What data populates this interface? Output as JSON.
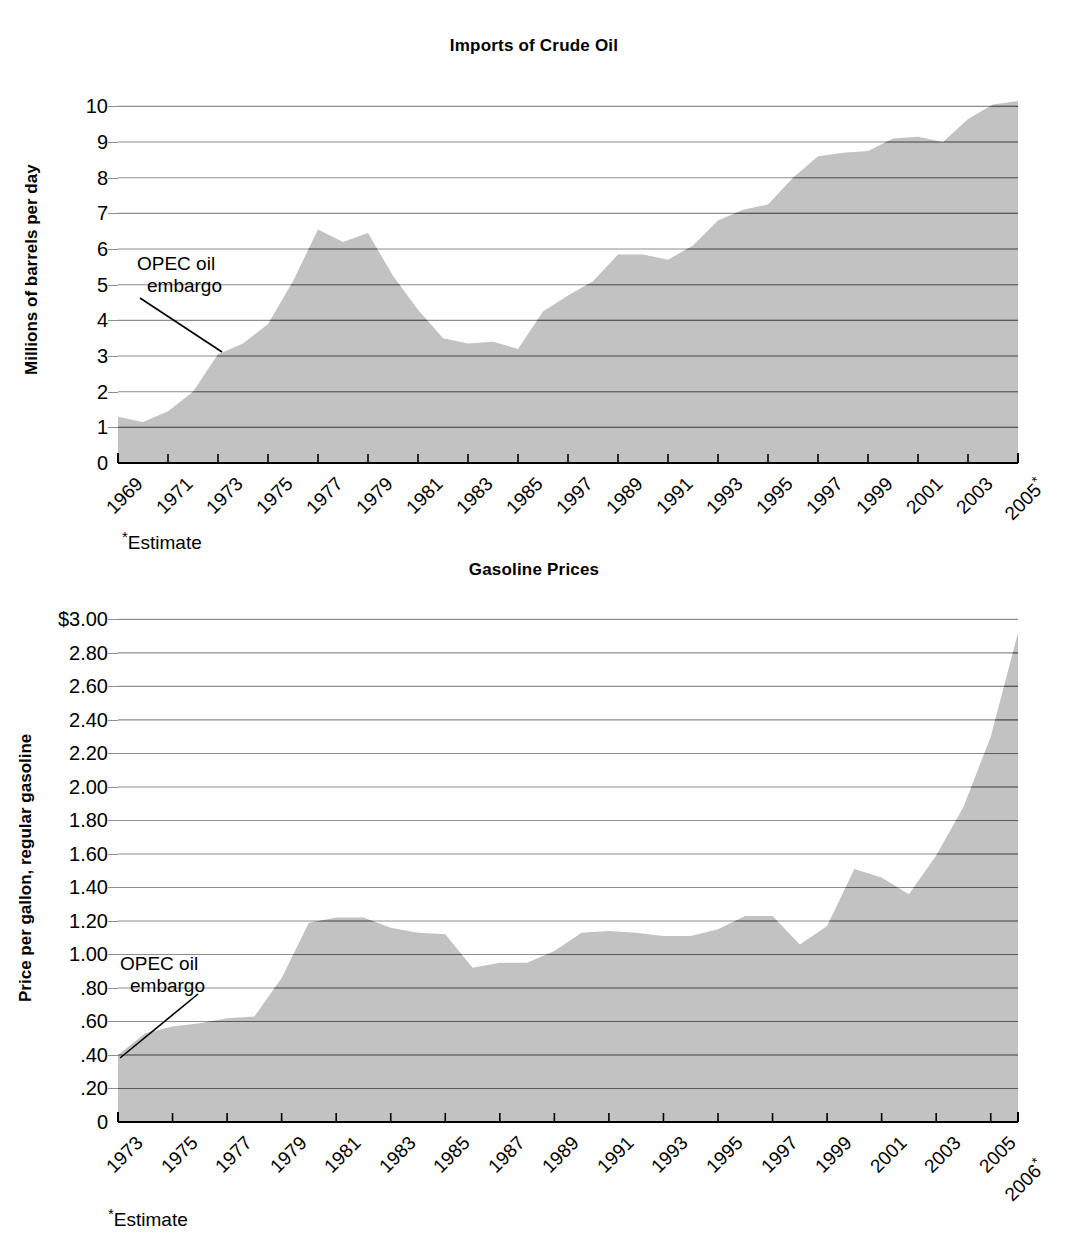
{
  "charts": [
    {
      "id": "imports-of-crude-oil",
      "title": "Imports of Crude Oil",
      "ylabel": "Millions of barrels per day",
      "annotation_line1": "OPEC oil",
      "annotation_line2": "embargo",
      "footnote_marker": "*",
      "footnote": "Estimate"
    },
    {
      "id": "gasoline-prices",
      "title": "Gasoline Prices",
      "ylabel": "Price per gallon, regular gasoline",
      "annotation_line1": "OPEC oil",
      "annotation_line2": "embargo",
      "footnote_marker": "*",
      "footnote": "Estimate"
    }
  ],
  "colors": {
    "area_fill": "#c2c2c2",
    "gridline": "#6f6f6f",
    "axis": "#000000",
    "text": "#000000"
  },
  "chart_data": [
    {
      "type": "area",
      "title": "Imports of Crude Oil",
      "xlabel": "",
      "ylabel": "Millions of barrels per day",
      "ylim": [
        0,
        10.6
      ],
      "yticks": [
        0,
        1,
        2,
        3,
        4,
        5,
        6,
        7,
        8,
        9,
        10
      ],
      "ytick_labels": [
        "0",
        "1",
        "2",
        "3",
        "4",
        "5",
        "6",
        "7",
        "8",
        "9",
        "10"
      ],
      "grid": true,
      "legend": "none",
      "xtick_labels": [
        "1969",
        "1971",
        "1973",
        "1975",
        "1977",
        "1979",
        "1981",
        "1983",
        "1985",
        "1997",
        "1989",
        "1991",
        "1993",
        "1995",
        "1997",
        "1999",
        "2001",
        "2003",
        "2005*"
      ],
      "annotations": [
        {
          "text": "OPEC oil embargo",
          "points_to_year": 1973,
          "points_to_value": 3.2
        }
      ],
      "x": [
        1969,
        1970,
        1971,
        1972,
        1973,
        1974,
        1975,
        1976,
        1977,
        1978,
        1979,
        1980,
        1981,
        1982,
        1983,
        1984,
        1985,
        1986,
        1987,
        1988,
        1989,
        1990,
        1991,
        1992,
        1993,
        1994,
        1995,
        1996,
        1997,
        1998,
        1999,
        2000,
        2001,
        2002,
        2003,
        2004,
        2005
      ],
      "values": [
        1.3,
        1.15,
        1.45,
        2.0,
        3.05,
        3.35,
        3.9,
        5.1,
        6.55,
        6.2,
        6.45,
        5.25,
        4.3,
        3.5,
        3.35,
        3.4,
        3.2,
        4.25,
        4.7,
        5.1,
        5.85,
        5.85,
        5.7,
        6.1,
        6.8,
        7.1,
        7.25,
        8.0,
        8.6,
        8.7,
        8.75,
        9.1,
        9.15,
        9.0,
        9.65,
        10.05,
        10.15
      ]
    },
    {
      "type": "area",
      "title": "Gasoline Prices",
      "xlabel": "",
      "ylabel": "Price per gallon, regular gasoline",
      "ylim": [
        0,
        3.08
      ],
      "yticks": [
        0,
        0.2,
        0.4,
        0.6,
        0.8,
        1.0,
        1.2,
        1.4,
        1.6,
        1.8,
        2.0,
        2.2,
        2.4,
        2.6,
        2.8,
        3.0
      ],
      "ytick_labels": [
        "0",
        ".20",
        ".40",
        ".60",
        ".80",
        "1.00",
        "1.20",
        "1.40",
        "1.60",
        "1.80",
        "2.00",
        "2.20",
        "2.40",
        "2.60",
        "2.80",
        "$3.00"
      ],
      "grid": true,
      "legend": "none",
      "xtick_labels": [
        "1973",
        "1975",
        "1977",
        "1979",
        "1981",
        "1983",
        "1985",
        "1987",
        "1989",
        "1991",
        "1993",
        "1995",
        "1997",
        "1999",
        "2001",
        "2003",
        "2005",
        "2006*"
      ],
      "annotations": [
        {
          "text": "OPEC oil embargo",
          "points_to_year": 1973,
          "points_to_value": 0.4
        }
      ],
      "x": [
        1973,
        1974,
        1975,
        1976,
        1977,
        1978,
        1979,
        1980,
        1981,
        1982,
        1983,
        1984,
        1985,
        1986,
        1987,
        1988,
        1989,
        1990,
        1991,
        1992,
        1993,
        1994,
        1995,
        1996,
        1997,
        1998,
        1999,
        2000,
        2001,
        2002,
        2003,
        2004,
        2005,
        2006
      ],
      "values": [
        0.4,
        0.53,
        0.57,
        0.59,
        0.62,
        0.63,
        0.86,
        1.19,
        1.22,
        1.22,
        1.16,
        1.13,
        1.12,
        0.92,
        0.95,
        0.95,
        1.02,
        1.13,
        1.14,
        1.13,
        1.11,
        1.11,
        1.15,
        1.23,
        1.23,
        1.06,
        1.17,
        1.51,
        1.46,
        1.36,
        1.59,
        1.88,
        2.3,
        2.92
      ]
    }
  ]
}
